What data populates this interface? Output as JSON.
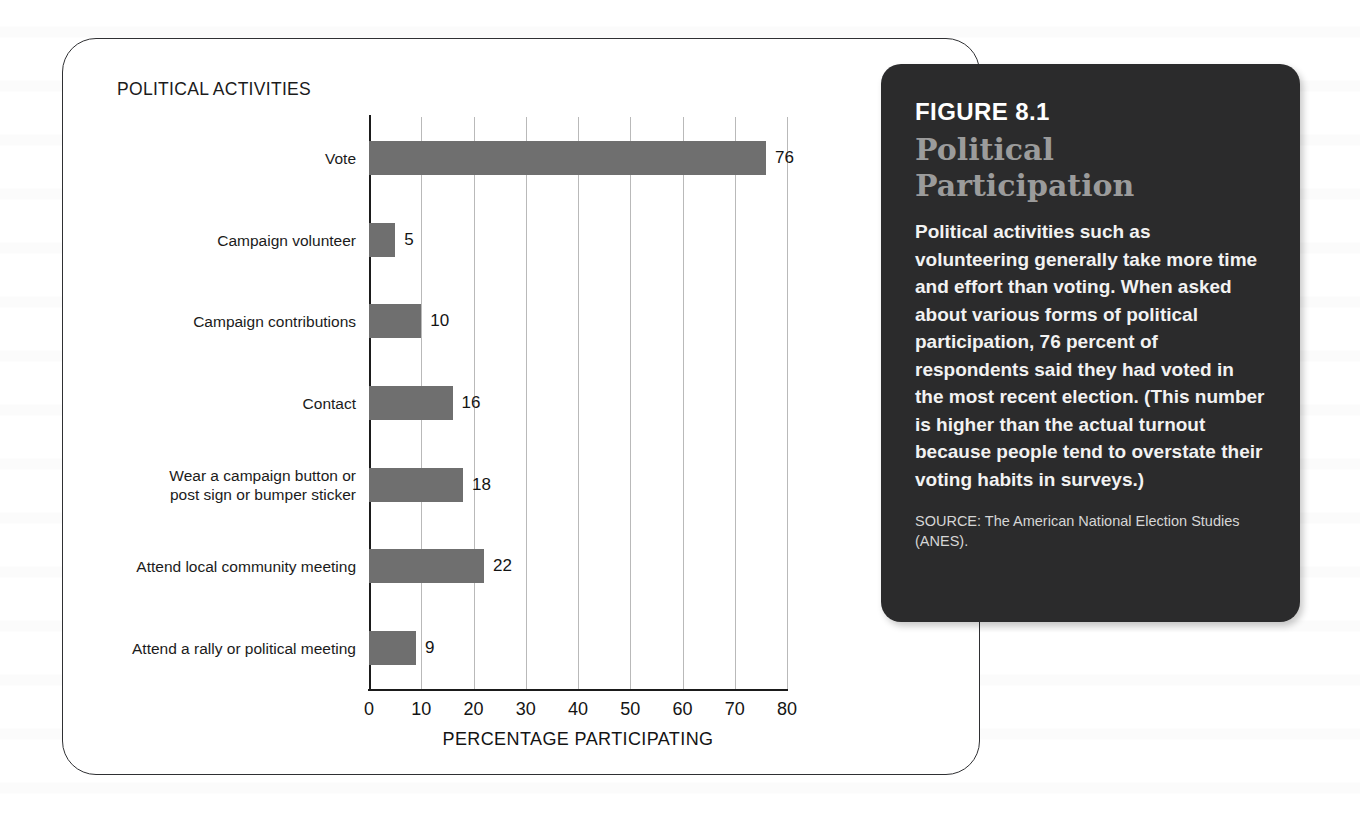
{
  "chart_panel": {
    "title": "POLITICAL ACTIVITIES",
    "x_axis_title": "PERCENTAGE PARTICIPATING"
  },
  "caption": {
    "figure_number": "FIGURE 8.1",
    "heading": "Political Participation",
    "body": "Political activities such as volunteering generally take more time and effort than voting. When asked about various forms of political participation, 76 percent of respondents said they had voted in the most recent election. (This number is higher than the actual turnout because people tend to overstate their voting habits in surveys.)",
    "source": "SOURCE: The American National Election Studies (ANES)."
  },
  "colors": {
    "bar": "#6f6f6f",
    "caption_background": "#2b2b2c",
    "caption_heading": "#9b9b9b",
    "axis": "#1b1b1b",
    "gridline": "#b9b9b9",
    "panel_background": "#ffffff"
  },
  "chart_data": {
    "type": "bar",
    "orientation": "horizontal",
    "title": "POLITICAL ACTIVITIES",
    "xlabel": "PERCENTAGE PARTICIPATING",
    "ylabel": "",
    "xlim": [
      0,
      80
    ],
    "xticks": [
      0,
      10,
      20,
      30,
      40,
      50,
      60,
      70,
      80
    ],
    "xtick_labels": [
      "0",
      "10",
      "20",
      "30",
      "40",
      "50",
      "60",
      "70",
      "80"
    ],
    "grid": true,
    "legend": false,
    "categories": [
      "Vote",
      "Campaign volunteer",
      "Campaign contributions",
      "Contact",
      "Wear a campaign button or\npost sign or bumper sticker",
      "Attend local community meeting",
      "Attend a rally or political meeting"
    ],
    "values": [
      76,
      5,
      10,
      16,
      18,
      22,
      9
    ],
    "value_labels": [
      "76",
      "5",
      "10",
      "16",
      "18",
      "22",
      "9"
    ],
    "bars": [
      {
        "label": "Vote",
        "value": 76,
        "value_label": "76"
      },
      {
        "label": "Campaign volunteer",
        "value": 5,
        "value_label": "5"
      },
      {
        "label": "Campaign contributions",
        "value": 10,
        "value_label": "10"
      },
      {
        "label": "Contact",
        "value": 16,
        "value_label": "16"
      },
      {
        "label": "Wear a campaign button or\npost sign or bumper sticker",
        "value": 18,
        "value_label": "18"
      },
      {
        "label": "Attend local community meeting",
        "value": 22,
        "value_label": "22"
      },
      {
        "label": "Attend a rally or political meeting",
        "value": 9,
        "value_label": "9"
      }
    ]
  }
}
